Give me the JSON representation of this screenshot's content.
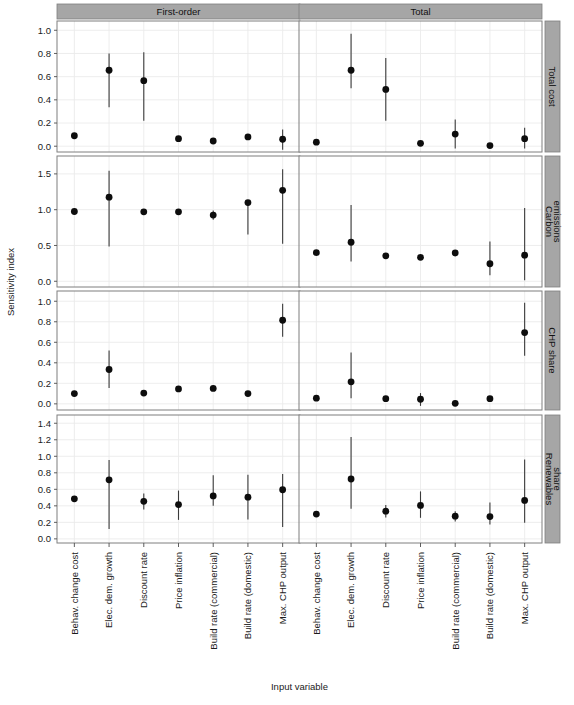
{
  "figure": {
    "ylabel": "Sensitivity index",
    "xlabel": "Input variable",
    "col_strips": [
      "First-order",
      "Total"
    ],
    "row_strips": [
      "Total cost",
      "Carbon\nemissions",
      "CHP share",
      "Renewables\nshare"
    ],
    "row_strips_flat": [
      "Total cost",
      "Carbon emissions",
      "CHP share",
      "Renewables share"
    ]
  },
  "chart_data": {
    "type": "scatter",
    "title": "",
    "xlabel": "Input variable",
    "ylabel": "Sensitivity index",
    "grid": true,
    "legend": false,
    "layout": {
      "nrows": 4,
      "ncols": 2,
      "col_facets": [
        "First-order",
        "Total"
      ],
      "row_facets": [
        "Total cost",
        "Carbon emissions",
        "CHP share",
        "Renewables share"
      ]
    },
    "categories": [
      "Behav. change cost",
      "Elec. dem. growth",
      "Discount rate",
      "Price inflation",
      "Build rate (commercial)",
      "Build rate (domestic)",
      "Max. CHP output"
    ],
    "error_bars": "vertical confidence intervals",
    "panels": [
      {
        "row": "Total cost",
        "col": "First-order",
        "ylim": [
          -0.05,
          1.08
        ],
        "yticks": [
          0.0,
          0.2,
          0.4,
          0.6,
          0.8,
          1.0
        ],
        "ytick_labels": [
          "0.0",
          "0.2",
          "0.4",
          "0.6",
          "0.8",
          "1.0"
        ],
        "values": [
          0.09,
          0.655,
          0.565,
          0.065,
          0.045,
          0.08,
          0.06
        ],
        "lower": [
          0.09,
          0.335,
          0.22,
          0.065,
          0.045,
          0.08,
          -0.03
        ],
        "upper": [
          0.09,
          0.8,
          0.81,
          0.065,
          0.045,
          0.08,
          0.145
        ]
      },
      {
        "row": "Total cost",
        "col": "Total",
        "ylim": [
          -0.05,
          1.08
        ],
        "yticks": [
          0.0,
          0.2,
          0.4,
          0.6,
          0.8,
          1.0
        ],
        "ytick_labels": [
          "0.0",
          "0.2",
          "0.4",
          "0.6",
          "0.8",
          "1.0"
        ],
        "values": [
          0.035,
          0.655,
          0.49,
          0.025,
          0.105,
          0.005,
          0.065
        ],
        "lower": [
          0.035,
          0.5,
          0.22,
          0.025,
          -0.02,
          0.005,
          -0.02
        ],
        "upper": [
          0.035,
          0.97,
          0.76,
          0.025,
          0.23,
          0.005,
          0.16
        ]
      },
      {
        "row": "Carbon emissions",
        "col": "First-order",
        "ylim": [
          -0.08,
          1.75
        ],
        "yticks": [
          0.0,
          0.5,
          1.0,
          1.5
        ],
        "ytick_labels": [
          "0.0",
          "0.5",
          "1.0",
          "1.5"
        ],
        "values": [
          0.975,
          1.175,
          0.97,
          0.97,
          0.925,
          1.1,
          1.27
        ],
        "lower": [
          0.975,
          0.485,
          0.93,
          0.97,
          0.86,
          0.655,
          0.525
        ],
        "upper": [
          0.975,
          1.545,
          1.01,
          0.97,
          0.99,
          1.105,
          1.565
        ]
      },
      {
        "row": "Carbon emissions",
        "col": "Total",
        "ylim": [
          -0.08,
          1.75
        ],
        "yticks": [
          0.0,
          0.5,
          1.0,
          1.5
        ],
        "ytick_labels": [
          "0.0",
          "0.5",
          "1.0",
          "1.5"
        ],
        "values": [
          0.4,
          0.545,
          0.355,
          0.335,
          0.395,
          0.245,
          0.365
        ],
        "lower": [
          0.4,
          0.275,
          0.355,
          0.335,
          0.395,
          0.085,
          0.015
        ],
        "upper": [
          0.4,
          1.065,
          0.355,
          0.335,
          0.395,
          0.555,
          1.025
        ]
      },
      {
        "row": "CHP share",
        "col": "First-order",
        "ylim": [
          -0.06,
          1.1
        ],
        "yticks": [
          0.0,
          0.2,
          0.4,
          0.6,
          0.8,
          1.0
        ],
        "ytick_labels": [
          "0.0",
          "0.2",
          "0.4",
          "0.6",
          "0.8",
          "1.0"
        ],
        "values": [
          0.1,
          0.335,
          0.105,
          0.145,
          0.15,
          0.1,
          0.815
        ],
        "lower": [
          0.1,
          0.155,
          0.105,
          0.145,
          0.15,
          0.1,
          0.655
        ],
        "upper": [
          0.1,
          0.52,
          0.105,
          0.145,
          0.15,
          0.1,
          0.975
        ]
      },
      {
        "row": "CHP share",
        "col": "Total",
        "ylim": [
          -0.06,
          1.1
        ],
        "yticks": [
          0.0,
          0.2,
          0.4,
          0.6,
          0.8,
          1.0
        ],
        "ytick_labels": [
          "0.0",
          "0.2",
          "0.4",
          "0.6",
          "0.8",
          "1.0"
        ],
        "values": [
          0.055,
          0.215,
          0.05,
          0.045,
          0.005,
          0.05,
          0.695
        ],
        "lower": [
          0.055,
          0.055,
          0.05,
          -0.02,
          0.005,
          0.05,
          0.47
        ],
        "upper": [
          0.055,
          0.5,
          0.05,
          0.105,
          0.005,
          0.05,
          0.985
        ]
      },
      {
        "row": "Renewables share",
        "col": "First-order",
        "ylim": [
          -0.05,
          1.5
        ],
        "yticks": [
          0.0,
          0.2,
          0.4,
          0.6,
          0.8,
          1.0,
          1.2,
          1.4
        ],
        "ytick_labels": [
          "0.0",
          "0.2",
          "0.4",
          "0.6",
          "0.8",
          "1.0",
          "1.2",
          "1.4"
        ],
        "values": [
          0.485,
          0.715,
          0.455,
          0.415,
          0.52,
          0.505,
          0.595
        ],
        "lower": [
          0.485,
          0.12,
          0.355,
          0.23,
          0.4,
          0.235,
          0.145
        ],
        "upper": [
          0.485,
          0.955,
          0.55,
          0.585,
          0.77,
          0.775,
          0.785
        ]
      },
      {
        "row": "Renewables share",
        "col": "Total",
        "ylim": [
          -0.05,
          1.5
        ],
        "yticks": [
          0.0,
          0.2,
          0.4,
          0.6,
          0.8,
          1.0,
          1.2,
          1.4
        ],
        "ytick_labels": [
          "0.0",
          "0.2",
          "0.4",
          "0.6",
          "0.8",
          "1.0",
          "1.2",
          "1.4"
        ],
        "values": [
          0.3,
          0.725,
          0.335,
          0.405,
          0.275,
          0.27,
          0.465
        ],
        "lower": [
          0.3,
          0.365,
          0.26,
          0.255,
          0.21,
          0.175,
          0.195
        ],
        "upper": [
          0.3,
          1.235,
          0.41,
          0.575,
          0.335,
          0.44,
          0.96
        ]
      }
    ]
  },
  "colors": {
    "point": "#0d0d0d",
    "error_bar": "#3b3b3b",
    "strip_background": "#a6a6a6",
    "panel_border": "#7f7f7f",
    "gridline": "#ebebeb",
    "panel_background": "#ffffff"
  }
}
